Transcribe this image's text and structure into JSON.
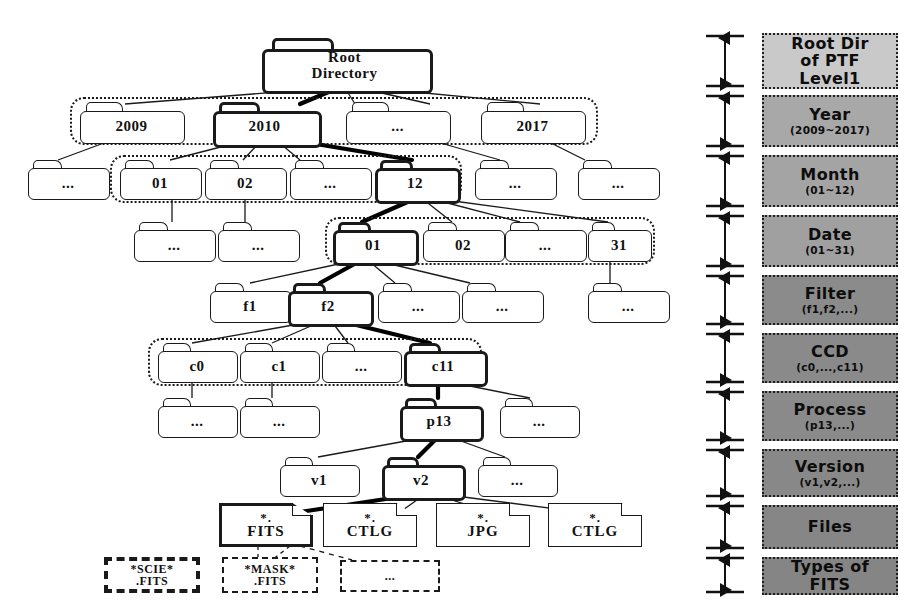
{
  "figure": {
    "type": "tree-diagram"
  },
  "tree": {
    "root": {
      "label": "Root\nDirectory",
      "line1": "Root",
      "line2": "Directory",
      "highlighted": true
    },
    "rows": [
      {
        "level": "year",
        "grouped": true,
        "nodes": [
          {
            "label": "2009",
            "highlighted": false
          },
          {
            "label": "2010",
            "highlighted": true
          },
          {
            "label": "...",
            "highlighted": false
          },
          {
            "label": "2017",
            "highlighted": false
          }
        ]
      },
      {
        "level": "month",
        "grouped": true,
        "nodes": [
          {
            "label": "...",
            "highlighted": false,
            "outside": true
          },
          {
            "label": "01",
            "highlighted": false
          },
          {
            "label": "02",
            "highlighted": false
          },
          {
            "label": "...",
            "highlighted": false
          },
          {
            "label": "12",
            "highlighted": true
          },
          {
            "label": "...",
            "highlighted": false,
            "outside": true
          },
          {
            "label": "...",
            "highlighted": false,
            "outside": true
          }
        ]
      },
      {
        "level": "date",
        "grouped": true,
        "nodes": [
          {
            "label": "...",
            "highlighted": false,
            "outside": true
          },
          {
            "label": "...",
            "highlighted": false,
            "outside": true
          },
          {
            "label": "01",
            "highlighted": true
          },
          {
            "label": "02",
            "highlighted": false
          },
          {
            "label": "...",
            "highlighted": false
          },
          {
            "label": "31",
            "highlighted": false
          }
        ]
      },
      {
        "level": "filter",
        "grouped": false,
        "nodes": [
          {
            "label": "f1",
            "highlighted": false
          },
          {
            "label": "f2",
            "highlighted": true
          },
          {
            "label": "...",
            "highlighted": false
          },
          {
            "label": "...",
            "highlighted": false
          },
          {
            "label": "...",
            "highlighted": false
          }
        ]
      },
      {
        "level": "ccd",
        "grouped": true,
        "nodes": [
          {
            "label": "c0",
            "highlighted": false
          },
          {
            "label": "c1",
            "highlighted": false
          },
          {
            "label": "...",
            "highlighted": false
          },
          {
            "label": "c11",
            "highlighted": true
          }
        ]
      },
      {
        "level": "process",
        "grouped": false,
        "nodes": [
          {
            "label": "...",
            "highlighted": false
          },
          {
            "label": "...",
            "highlighted": false
          },
          {
            "label": "p13",
            "highlighted": true
          },
          {
            "label": "...",
            "highlighted": false
          }
        ]
      },
      {
        "level": "version",
        "grouped": false,
        "nodes": [
          {
            "label": "v1",
            "highlighted": false
          },
          {
            "label": "v2",
            "highlighted": true
          },
          {
            "label": "...",
            "highlighted": false
          }
        ]
      }
    ],
    "files": [
      {
        "line1": "*.",
        "line2": "FITS",
        "highlighted": true
      },
      {
        "line1": "*.",
        "line2": "CTLG",
        "highlighted": false
      },
      {
        "line1": "*.",
        "line2": "JPG",
        "highlighted": false
      },
      {
        "line1": "*.",
        "line2": "CTLG",
        "highlighted": false
      }
    ],
    "fits_types": [
      {
        "line1": "*SCIE*",
        "line2": ".FITS",
        "emphasis": true
      },
      {
        "line1": "*MASK*",
        "line2": ".FITS",
        "emphasis": false
      },
      {
        "line1": "...",
        "line2": "",
        "emphasis": false
      }
    ]
  },
  "legend": {
    "levels": [
      {
        "title": "Root Dir of PTF Level1",
        "t1": "Root Dir",
        "t1b": "of PTF",
        "t1c": "Level1",
        "sub": "",
        "color": "#c9c9c9"
      },
      {
        "title": "Year",
        "sub": "(2009~2017)",
        "color": "#a8a8a8"
      },
      {
        "title": "Month",
        "sub": "(01~12)",
        "color": "#a4a4a4"
      },
      {
        "title": "Date",
        "sub": "(01~31)",
        "color": "#a0a0a0"
      },
      {
        "title": "Filter",
        "sub": "(f1,f2,...)",
        "color": "#8b8b8b"
      },
      {
        "title": "CCD",
        "sub": "(c0,...,c11)",
        "color": "#8a8a8a"
      },
      {
        "title": "Process",
        "sub": "(p13,...)",
        "color": "#8a8a8a"
      },
      {
        "title": "Version",
        "sub": "(v1,v2,...)",
        "color": "#888888"
      },
      {
        "title": "Files",
        "sub": "",
        "color": "#868686"
      },
      {
        "title": "Types of FITS",
        "t1": "Types of",
        "t1b": "FITS",
        "sub": "",
        "color": "#858585"
      }
    ]
  }
}
